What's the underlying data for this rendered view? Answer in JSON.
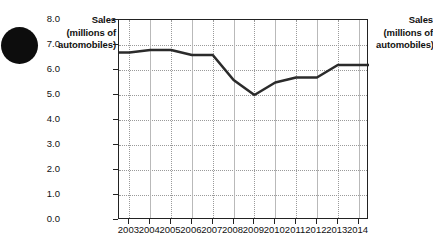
{
  "figure": {
    "bullet_marker": "filled-circle-bullet",
    "left_axis_title_lines": [
      "Sales",
      "(millions of",
      "automobiles)"
    ],
    "right_axis_title_lines": [
      "Sales",
      "(millions of",
      "automobiles)"
    ]
  },
  "chart_data": {
    "type": "line",
    "title": "",
    "xlabel": "",
    "ylabel": "Sales (millions of automobiles)",
    "categories": [
      "2003",
      "2004",
      "2005",
      "2006",
      "2007",
      "2008",
      "2009",
      "2010",
      "2011",
      "2012",
      "2013",
      "2014"
    ],
    "values": [
      6.7,
      6.8,
      6.8,
      6.6,
      6.6,
      5.6,
      5.0,
      5.5,
      5.7,
      5.7,
      6.2,
      6.2
    ],
    "ylim": [
      0.0,
      8.0
    ],
    "ytick_labels": [
      "8.0",
      "7.0",
      "6.0",
      "5.0",
      "4.0",
      "3.0",
      "2.0",
      "1.0",
      "0.0"
    ],
    "ytick_values": [
      8.0,
      7.0,
      6.0,
      5.0,
      4.0,
      3.0,
      2.0,
      1.0,
      0.0
    ],
    "grid": true,
    "legend": "none",
    "line_color": "#2b2b2b",
    "grid_color": "#9a9a9a"
  }
}
